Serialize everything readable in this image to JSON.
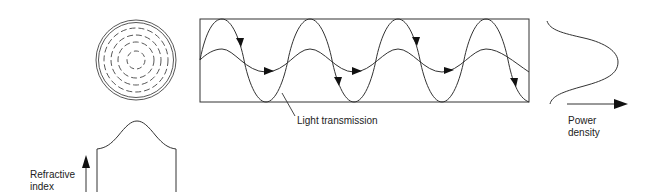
{
  "diagram": {
    "labels": {
      "light_transmission": "Light transmission",
      "power_density_line1": "Power",
      "power_density_line2": "density",
      "refractive_index_line1": "Refractive",
      "refractive_index_line2": "index"
    },
    "components": [
      {
        "name": "fiber-cross-section",
        "description": "Concentric circles: solid outer ring with dashed inner rings"
      },
      {
        "name": "fiber-longitudinal-view",
        "description": "Rectangle with two sinusoidal light ray paths with direction arrows"
      },
      {
        "name": "power-density-profile",
        "description": "Bell-shaped curve with horizontal arrow"
      },
      {
        "name": "refractive-index-profile",
        "description": "Bell-shaped top profile with vertical arrow"
      }
    ],
    "colors": {
      "line": "#333333",
      "background": "#ffffff"
    }
  }
}
